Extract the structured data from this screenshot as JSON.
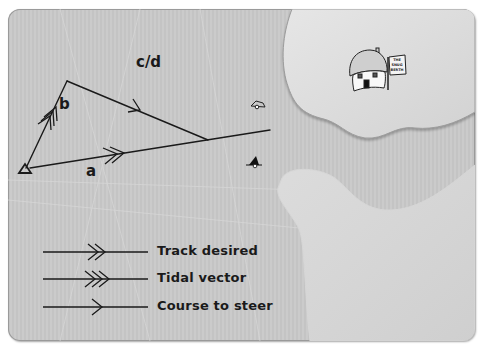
{
  "diagram": {
    "labels": {
      "a": "a",
      "b": "b",
      "cd": "c/d"
    },
    "sign_text": [
      "THE",
      "SNUG",
      "BERTH"
    ],
    "icons": [
      "start-triangle-icon",
      "house-icon",
      "sign-icon",
      "buoy-icon",
      "boat-icon"
    ]
  },
  "legend": {
    "items": [
      {
        "label": "Track desired",
        "arrow": "double-chevron"
      },
      {
        "label": "Tidal vector",
        "arrow": "triple-chevron"
      },
      {
        "label": "Course to steer",
        "arrow": "single-chevron"
      }
    ]
  },
  "colors": {
    "sea": "#c6c6c6",
    "land": "#dcdcdc",
    "line": "#1a1a1a"
  }
}
